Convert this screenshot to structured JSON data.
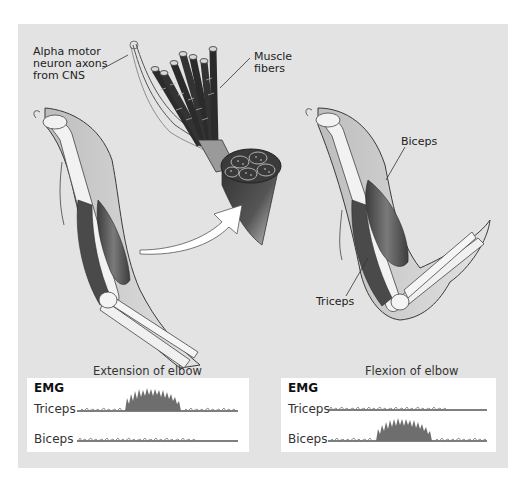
{
  "figure": {
    "background_color": "#e3e3e3",
    "labels": {
      "alpha_motor": [
        "Alpha motor",
        "neuron axons",
        "from CNS"
      ],
      "muscle_fibers": [
        "Muscle",
        "fibers"
      ],
      "biceps": "Biceps",
      "triceps": "Triceps"
    }
  },
  "emg_panels": [
    {
      "caption": "Extension of elbow",
      "title": "EMG",
      "rows": [
        {
          "label": "Triceps",
          "activity": "burst"
        },
        {
          "label": "Biceps",
          "activity": "baseline"
        }
      ]
    },
    {
      "caption": "Flexion of elbow",
      "title": "EMG",
      "rows": [
        {
          "label": "Triceps",
          "activity": "baseline"
        },
        {
          "label": "Biceps",
          "activity": "burst"
        }
      ]
    }
  ],
  "colors": {
    "emg_fill": "#6e6e6e",
    "emg_baseline": "#555555",
    "muscle": "#5a5a5a",
    "bone": "#f2f2f2",
    "skin_outline": "#3a3a3a"
  }
}
